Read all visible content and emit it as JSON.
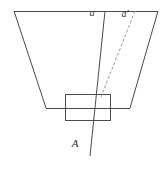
{
  "figure": {
    "background_color": "#ffffff",
    "stroke_color": "#4a4a4a",
    "dash_color": "#9a9a9a",
    "text_color": "#2b2b2b",
    "width": 166,
    "height": 173
  },
  "labels": {
    "ray_solid": "a",
    "ray_dashed": "a'",
    "point_A": "A"
  },
  "chart_data": {
    "type": "diagram",
    "xlabel": "",
    "ylabel": "",
    "xlim": [
      0,
      166
    ],
    "ylim": [
      0,
      173
    ],
    "grid": false,
    "legend": "none",
    "shapes": [
      {
        "name": "trapezoid-cone",
        "kind": "polyline",
        "closed": false,
        "style": "solid",
        "stroke": "#4a4a4a",
        "points": [
          [
            14,
            11
          ],
          [
            158,
            11
          ]
        ]
      },
      {
        "name": "trapezoid-left-edge",
        "kind": "line",
        "style": "solid",
        "stroke": "#4a4a4a",
        "points": [
          [
            14,
            11
          ],
          [
            46,
            108
          ]
        ]
      },
      {
        "name": "trapezoid-right-edge",
        "kind": "line",
        "style": "solid",
        "stroke": "#4a4a4a",
        "points": [
          [
            158,
            11
          ],
          [
            130,
            108
          ]
        ]
      },
      {
        "name": "trapezoid-bottom-edge",
        "kind": "line",
        "style": "solid",
        "stroke": "#4a4a4a",
        "points": [
          [
            46,
            108
          ],
          [
            130,
            108
          ]
        ]
      },
      {
        "name": "aperture-rectangle",
        "kind": "rect",
        "style": "solid",
        "stroke": "#4a4a4a",
        "fill": "none",
        "x": 65,
        "y": 94,
        "width": 46,
        "height": 27
      },
      {
        "name": "ray-a-solid",
        "kind": "line",
        "style": "solid",
        "stroke": "#4a4a4a",
        "points": [
          [
            105,
            11
          ],
          [
            90,
            156
          ]
        ]
      },
      {
        "name": "ray-a-prime-dashed",
        "kind": "line",
        "style": "dashed",
        "stroke": "#9a9a9a",
        "dasharray": "3,2",
        "points": [
          [
            135,
            11
          ],
          [
            101,
            97
          ]
        ]
      }
    ],
    "annotations": [
      {
        "text": "a",
        "x": 92,
        "y": 18,
        "style": "italic"
      },
      {
        "text": "a'",
        "x": 125,
        "y": 19,
        "style": "italic"
      },
      {
        "text": "A",
        "x": 75,
        "y": 149,
        "style": "italic"
      }
    ]
  }
}
